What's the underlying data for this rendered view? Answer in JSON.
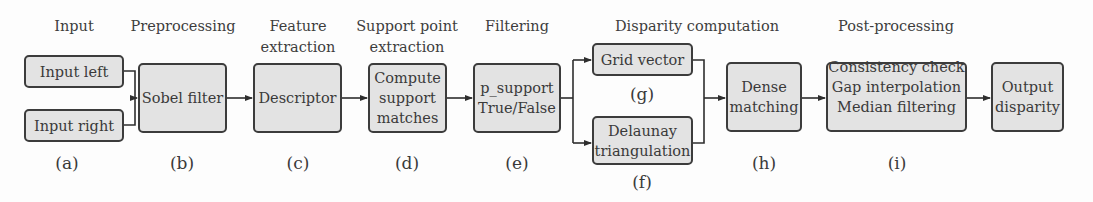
{
  "diagram": {
    "stages": [
      {
        "id": "input",
        "label": "Input"
      },
      {
        "id": "preprocessing",
        "label": "Preprocessing"
      },
      {
        "id": "feature",
        "label": "Feature\nextraction"
      },
      {
        "id": "support",
        "label": "Support point\nextraction"
      },
      {
        "id": "filtering",
        "label": "Filtering"
      },
      {
        "id": "disparity",
        "label": "Disparity computation"
      },
      {
        "id": "post",
        "label": "Post-processing"
      }
    ],
    "nodes": [
      {
        "id": "input_left",
        "text": "Input left"
      },
      {
        "id": "input_right",
        "text": "Input right"
      },
      {
        "id": "sobel",
        "text": "Sobel filter"
      },
      {
        "id": "descriptor",
        "text": "Descriptor"
      },
      {
        "id": "compute_support",
        "text": "Compute\nsupport\nmatches"
      },
      {
        "id": "p_support",
        "text": "p_support\nTrue/False"
      },
      {
        "id": "grid_vector",
        "text": "Grid vector"
      },
      {
        "id": "delaunay",
        "text": "Delaunay\ntriangulation"
      },
      {
        "id": "dense",
        "text": "Dense\nmatching"
      },
      {
        "id": "post",
        "text": "Consistency check\nGap interpolation\nMedian filtering ..."
      },
      {
        "id": "output",
        "text": "Output\ndisparity"
      }
    ],
    "step_labels": [
      "(a)",
      "(b)",
      "(c)",
      "(d)",
      "(e)",
      "(f)",
      "(g)",
      "(h)",
      "(i)"
    ],
    "edges": [
      [
        "input_left",
        "sobel"
      ],
      [
        "input_right",
        "sobel"
      ],
      [
        "sobel",
        "descriptor"
      ],
      [
        "descriptor",
        "compute_support"
      ],
      [
        "compute_support",
        "p_support"
      ],
      [
        "p_support",
        "grid_vector"
      ],
      [
        "p_support",
        "delaunay"
      ],
      [
        "grid_vector",
        "dense"
      ],
      [
        "delaunay",
        "dense"
      ],
      [
        "dense",
        "post"
      ],
      [
        "post",
        "output"
      ]
    ],
    "colors": {
      "box_fill": "#e3e3e3",
      "box_border": "#3c3c3c",
      "line": "#2e2e2e",
      "text": "#3a3a3a"
    }
  }
}
